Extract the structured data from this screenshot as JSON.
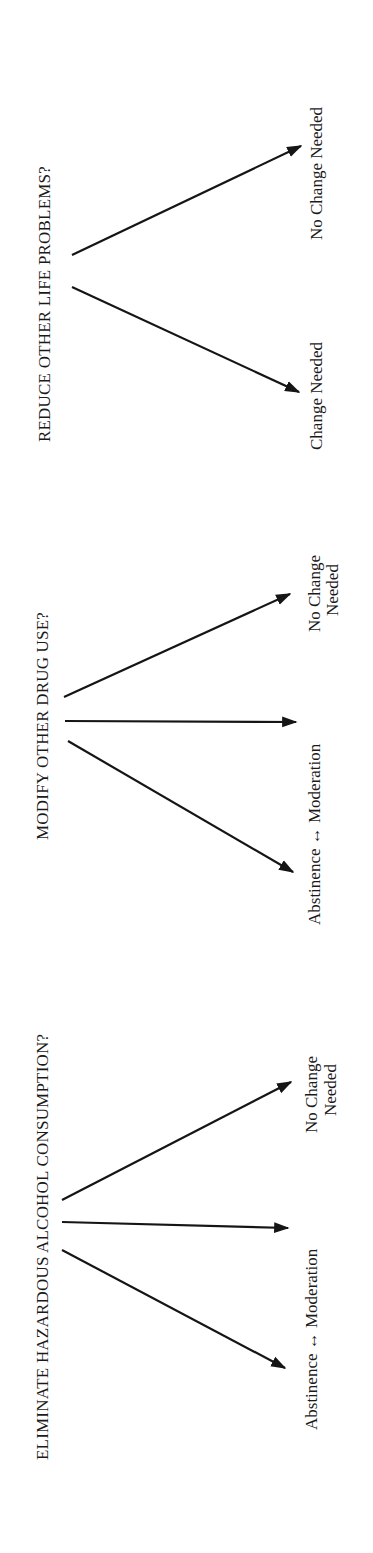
{
  "diagram": {
    "orientation": "rotated-90-ccw",
    "sections": [
      {
        "id": "alcohol",
        "title": "ELIMINATE HAZARDOUS ALCOHOL CONSUMPTION?",
        "branches": [
          {
            "label": "Abstinence ↔ Moderation",
            "kind": "range"
          },
          {
            "label": "No Change",
            "label2": "Needed",
            "kind": "no-change"
          }
        ]
      },
      {
        "id": "drug",
        "title": "MODIFY OTHER DRUG USE?",
        "branches": [
          {
            "label": "Abstinence ↔ Moderation",
            "kind": "range"
          },
          {
            "label": "No Change",
            "label2": "Needed",
            "kind": "no-change"
          }
        ]
      },
      {
        "id": "life",
        "title": "REDUCE OTHER LIFE PROBLEMS?",
        "branches": [
          {
            "label": "Change Needed",
            "kind": "change"
          },
          {
            "label": "No Change Needed",
            "kind": "no-change"
          }
        ]
      }
    ]
  }
}
